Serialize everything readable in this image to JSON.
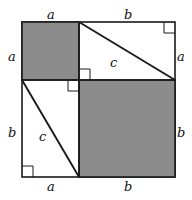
{
  "figure": {
    "colors": {
      "shaded_square_fill": "#8c8c8c",
      "unshaded_fill": "#ffffff",
      "stroke": "#1a1a1a",
      "background": "#ffffff"
    },
    "geometry": {
      "outer_square": {
        "x": 22,
        "y": 22,
        "side": 153
      },
      "split_x": 79,
      "split_y": 80,
      "leg_a": 57,
      "leg_b": 96,
      "stroke_width_outer": 1.6,
      "stroke_width_inner": 1.6,
      "stroke_width_hypotenuse": 1.9,
      "stroke_width_right_angle": 1.0,
      "right_angle_marker_size": 11
    },
    "shaded_regions": [
      {
        "name": "square-a-squared",
        "x": 22,
        "y": 22,
        "width": 57,
        "height": 58
      },
      {
        "name": "square-b-squared",
        "x": 79,
        "y": 80,
        "width": 96,
        "height": 97
      }
    ],
    "hypotenuses": [
      {
        "name": "hypotenuse-upper-right",
        "x1": 79,
        "y1": 22,
        "x2": 175,
        "y2": 80
      },
      {
        "name": "hypotenuse-lower-left",
        "x1": 22,
        "y1": 80,
        "x2": 79,
        "y2": 177
      }
    ],
    "right_angle_markers": [
      {
        "name": "right-angle-top-right",
        "corner_x": 175,
        "corner_y": 22,
        "dx": -1,
        "dy": 1
      },
      {
        "name": "right-angle-bottom-left",
        "corner_x": 22,
        "corner_y": 177,
        "dx": 1,
        "dy": -1
      },
      {
        "name": "right-angle-center-upper",
        "corner_x": 79,
        "corner_y": 80,
        "dx": 1,
        "dy": -1
      },
      {
        "name": "right-angle-center-lower",
        "corner_x": 79,
        "corner_y": 80,
        "dx": -1,
        "dy": 1
      }
    ],
    "labels": {
      "a_top": "a",
      "b_top": "b",
      "a_left": "a",
      "a_right": "a",
      "b_left": "b",
      "b_right": "b",
      "a_bottom": "a",
      "b_bottom": "b",
      "c_upper": "c",
      "c_lower": "c"
    }
  }
}
